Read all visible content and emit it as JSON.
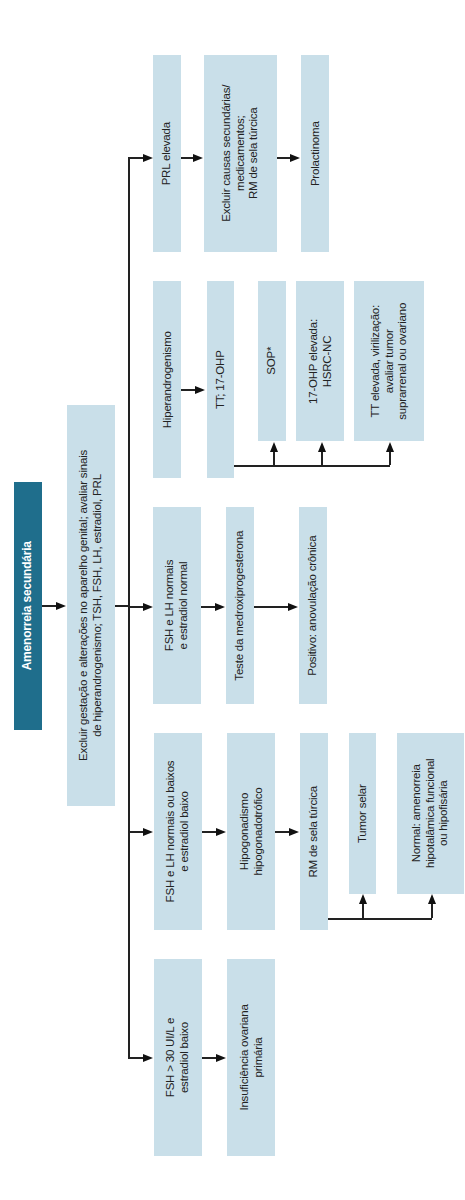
{
  "diagram": {
    "title": "Amenorreia secundária",
    "start": "Excluir gestação e alterações no aparelho genital; avaliar sinais\nde hiperandrogenismo; TSH, FSH, LH, estradiol, PRL",
    "branches": [
      {
        "condition": "PRL elevada",
        "steps": [
          "Excluir causas secundárias/\nmedicamentos;\nRM de sela túrcica",
          "Prolactinoma"
        ]
      },
      {
        "condition": "Hiperandrogenismo",
        "steps": [
          "TT; 17-OHP"
        ],
        "outcomes": [
          "SOP*",
          "17-OHP elevada:\nHSRC-NC",
          "TT elevada, virilização:\navaliar tumor\nsuprarrenal ou ovariano"
        ]
      },
      {
        "condition": "FSH e LH normais\ne estradiol normal",
        "steps": [
          "Teste da medroxiprogesterona",
          "Positivo: anovulação crônica"
        ]
      },
      {
        "condition": "FSH e LH normais ou baixos\ne estradiol baixo",
        "steps": [
          "Hipogonadismo\nhipogonadotrófico",
          "RM de sela túrcica"
        ],
        "outcomes": [
          "Tumor selar",
          "Normal: amenorreia\nhipotalâmica funcional\nou hipofisária"
        ]
      },
      {
        "condition": "FSH > 30 UI/L e\nestradiol baixo",
        "steps": [
          "Insuficiência ovariana\nprimária"
        ]
      }
    ],
    "colors": {
      "box": "#c9dfe9",
      "title_box": "#1f6e8c",
      "line": "#222222"
    }
  }
}
